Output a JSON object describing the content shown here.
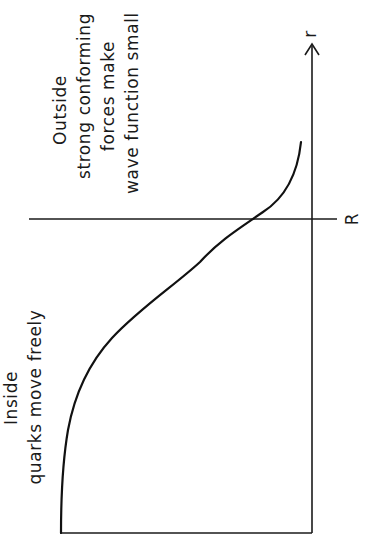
{
  "diagram": {
    "orientation": "rotated -90 degrees",
    "axis": {
      "label": "r",
      "boundary_label": "R"
    },
    "regions": {
      "outside": {
        "title": "Outside",
        "lines": [
          "strong conforming",
          "forces make",
          "wave function small"
        ]
      },
      "inside": {
        "title": "Inside",
        "lines": [
          "quarks move freely"
        ]
      }
    },
    "curve": {
      "description": "wave function: flat inside, drops sharply near R, small tail outside"
    },
    "colors": {
      "ink": "#1a1a1a",
      "background": "#ffffff"
    }
  }
}
